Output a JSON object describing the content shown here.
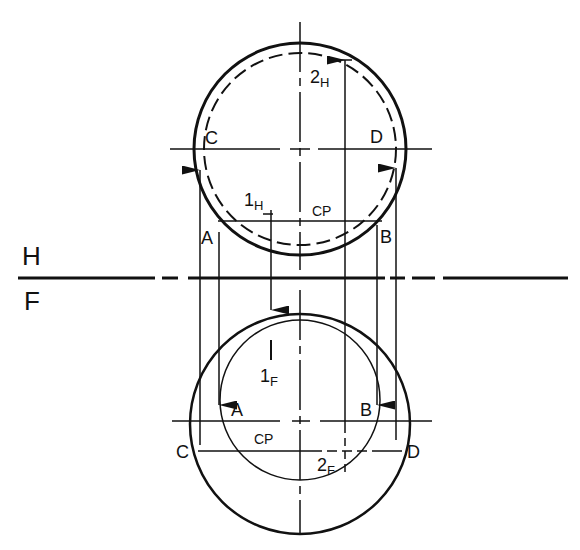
{
  "diagram": {
    "fold_line": {
      "top_label": "H",
      "bottom_label": "F"
    },
    "top_view": {
      "labels": {
        "C": "C",
        "D": "D",
        "A": "A",
        "B": "B",
        "point1": "1",
        "point1_sub": "H",
        "point2": "2",
        "point2_sub": "H",
        "cutting_plane": "CP"
      }
    },
    "front_view": {
      "labels": {
        "C": "C",
        "D": "D",
        "A": "A",
        "B": "B",
        "point1": "1",
        "point1_sub": "F",
        "point2": "2",
        "point2_sub": "F",
        "cutting_plane": "CP"
      }
    },
    "colors": {
      "line": "#111111",
      "background": "#ffffff"
    }
  }
}
